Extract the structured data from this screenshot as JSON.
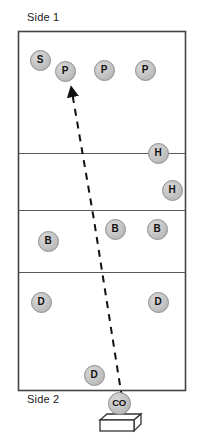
{
  "diagram": {
    "court": {
      "x": 18,
      "y": 31,
      "width": 168,
      "height": 360,
      "border_color": "#444444",
      "fill_color": "#ffffff",
      "line_color": "#555555",
      "divider_lines_y": [
        153,
        210,
        272
      ]
    },
    "labels": {
      "side1": "Side 1",
      "side2": "Side 2"
    },
    "token_style": {
      "fill_color": "#c6c6c6",
      "border_color": "#8c8c8c",
      "text_color": "#111111"
    },
    "arrow": {
      "label": "serve-path-arrow",
      "style": "dashed",
      "color": "#111111",
      "start_x": 122,
      "start_y": 398,
      "end_x": 72,
      "end_y": 88,
      "head_at": "end"
    },
    "bench": {
      "label": "coach-box",
      "x": 100,
      "y": 414,
      "width": 41,
      "height": 17,
      "depth": 7,
      "fill_color": "#ffffff",
      "border_color": "#333333"
    },
    "tokens": [
      {
        "id": "setter-1",
        "label": "S",
        "x": 40,
        "y": 60,
        "size": "sm"
      },
      {
        "id": "passer-1",
        "label": "P",
        "x": 65,
        "y": 71,
        "size": "sm"
      },
      {
        "id": "passer-2",
        "label": "P",
        "x": 104,
        "y": 70,
        "size": "sm"
      },
      {
        "id": "passer-3",
        "label": "P",
        "x": 145,
        "y": 70,
        "size": "sm"
      },
      {
        "id": "hitter-1",
        "label": "H",
        "x": 158,
        "y": 153,
        "size": "sm"
      },
      {
        "id": "hitter-2",
        "label": "H",
        "x": 172,
        "y": 190,
        "size": "sm"
      },
      {
        "id": "blocker-1",
        "label": "B",
        "x": 48,
        "y": 241,
        "size": "sm"
      },
      {
        "id": "blocker-2",
        "label": "B",
        "x": 115,
        "y": 229,
        "size": "sm"
      },
      {
        "id": "blocker-3",
        "label": "B",
        "x": 157,
        "y": 229,
        "size": "sm"
      },
      {
        "id": "defender-1",
        "label": "D",
        "x": 41,
        "y": 302,
        "size": "sm"
      },
      {
        "id": "defender-2",
        "label": "D",
        "x": 158,
        "y": 302,
        "size": "sm"
      },
      {
        "id": "defender-3",
        "label": "D",
        "x": 94,
        "y": 375,
        "size": "sm"
      },
      {
        "id": "coach",
        "label": "CO",
        "x": 119,
        "y": 403,
        "size": "co"
      }
    ]
  }
}
